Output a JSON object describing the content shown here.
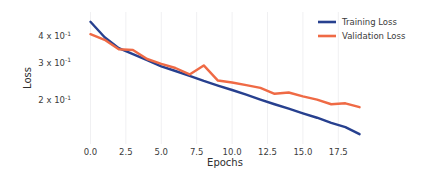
{
  "chart_data": {
    "type": "line",
    "title": "",
    "xlabel": "Epochs",
    "ylabel": "Loss",
    "yscale": "log",
    "xlim": [
      -0.95,
      19.95
    ],
    "ylim": [
      0.125,
      0.52
    ],
    "grid": "vertical-only",
    "legend_position": "upper-right",
    "x": [
      0,
      1,
      2,
      3,
      4,
      5,
      6,
      7,
      8,
      9,
      10,
      11,
      12,
      13,
      14,
      15,
      16,
      17,
      18,
      19
    ],
    "xticks": [
      "0.0",
      "2.5",
      "5.0",
      "7.5",
      "10.0",
      "12.5",
      "15.0",
      "17.5"
    ],
    "xtick_values": [
      0.0,
      2.5,
      5.0,
      7.5,
      10.0,
      12.5,
      15.0,
      17.5
    ],
    "yticks": [
      "4 x 10",
      "3 x 10",
      "2 x 10"
    ],
    "ytick_exponents": [
      "-1",
      "-1",
      "-1"
    ],
    "ytick_values": [
      0.4,
      0.3,
      0.2
    ],
    "series": [
      {
        "name": "Training Loss",
        "color": "#27408f",
        "values": [
          0.468,
          0.396,
          0.352,
          0.33,
          0.309,
          0.289,
          0.275,
          0.261,
          0.247,
          0.235,
          0.224,
          0.213,
          0.202,
          0.192,
          0.183,
          0.174,
          0.166,
          0.157,
          0.15,
          0.139
        ]
      },
      {
        "name": "Validation Loss",
        "color": "#ef6a45",
        "values": [
          0.409,
          0.385,
          0.348,
          0.345,
          0.313,
          0.297,
          0.284,
          0.265,
          0.292,
          0.248,
          0.243,
          0.236,
          0.229,
          0.215,
          0.218,
          0.209,
          0.202,
          0.192,
          0.194,
          0.186
        ]
      }
    ]
  },
  "legend": {
    "items": [
      {
        "label": "Training Loss",
        "color": "#27408f"
      },
      {
        "label": "Validation Loss",
        "color": "#ef6a45"
      }
    ]
  },
  "axes": {
    "x_title": "Epochs",
    "y_title": "Loss"
  }
}
